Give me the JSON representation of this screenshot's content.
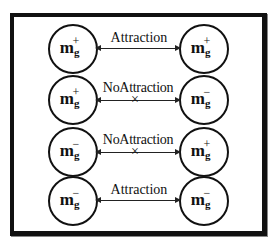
{
  "diagram": {
    "title": "",
    "rows": [
      {
        "left": {
          "base": "m",
          "sub": "g",
          "sign": "+"
        },
        "right": {
          "base": "m",
          "sub": "g",
          "sign": "+"
        },
        "relation": "Attraction",
        "blocked": false
      },
      {
        "left": {
          "base": "m",
          "sub": "g",
          "sign": "+"
        },
        "right": {
          "base": "m",
          "sub": "g",
          "sign": "−"
        },
        "relation": "NoAttraction",
        "blocked": true
      },
      {
        "left": {
          "base": "m",
          "sub": "g",
          "sign": "−"
        },
        "right": {
          "base": "m",
          "sub": "g",
          "sign": "+"
        },
        "relation": "NoAttraction",
        "blocked": true
      },
      {
        "left": {
          "base": "m",
          "sub": "g",
          "sign": "−"
        },
        "right": {
          "base": "m",
          "sub": "g",
          "sign": "−"
        },
        "relation": "Attraction",
        "blocked": false
      }
    ],
    "cross_symbol": "×"
  }
}
